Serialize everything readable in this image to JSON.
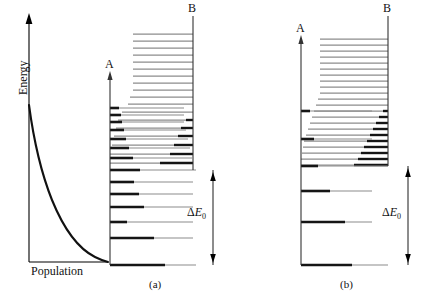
{
  "figure": {
    "type": "energy-level-diagram"
  },
  "population_panel": {
    "y_axis_label": "Energy",
    "x_axis_label": "Population",
    "curve_type": "exponential-decay",
    "axis_arrow": "up"
  },
  "panels": [
    {
      "id": "a",
      "caption": "(a)",
      "left_axis_label": "A",
      "right_axis_label": "B",
      "gap_label_delta": "Δ",
      "gap_label_e": "E",
      "gap_label_sub": "0"
    },
    {
      "id": "b",
      "caption": "(b)",
      "left_axis_label": "A",
      "right_axis_label": "B",
      "gap_label_delta": "Δ",
      "gap_label_e": "E",
      "gap_label_sub": "0"
    }
  ],
  "colors": {
    "line": "#000000",
    "level_gray": "#8c8c8c",
    "level_dark": "#151515",
    "background": "#ffffff"
  },
  "chart_data": {
    "type": "line",
    "title": "",
    "xlabel": "Population",
    "ylabel": "Energy",
    "series": [
      {
        "name": "Boltzmann population",
        "x": [
          0.0,
          0.06,
          0.13,
          0.2,
          0.28,
          0.36,
          0.45,
          0.55,
          0.66,
          0.78,
          0.9,
          1.0
        ],
        "y": [
          1.0,
          0.82,
          0.66,
          0.53,
          0.41,
          0.31,
          0.23,
          0.16,
          0.1,
          0.06,
          0.025,
          0.0
        ]
      }
    ],
    "xlim": [
      0,
      1
    ],
    "ylim": [
      0,
      1
    ],
    "grid": false,
    "legend": "none"
  },
  "levels_a": {
    "axis_a_top_y": 78,
    "axis_b_top_y": 16,
    "baseline_y": 265,
    "threshold_y": 170,
    "b_levels": [
      {
        "y": 34,
        "x1": 133,
        "x2": 193,
        "dark_from": null
      },
      {
        "y": 41,
        "x1": 133,
        "x2": 193,
        "dark_from": null
      },
      {
        "y": 48,
        "x1": 133,
        "x2": 193,
        "dark_from": null
      },
      {
        "y": 55,
        "x1": 133,
        "x2": 193,
        "dark_from": null
      },
      {
        "y": 62,
        "x1": 133,
        "x2": 193,
        "dark_from": null
      },
      {
        "y": 69,
        "x1": 133,
        "x2": 193,
        "dark_from": null
      },
      {
        "y": 76,
        "x1": 133,
        "x2": 193,
        "dark_from": null
      },
      {
        "y": 83,
        "x1": 133,
        "x2": 193,
        "dark_from": null
      },
      {
        "y": 90,
        "x1": 133,
        "x2": 193,
        "dark_from": null
      },
      {
        "y": 97,
        "x1": 130,
        "x2": 193,
        "dark_from": null
      },
      {
        "y": 104,
        "x1": 128,
        "x2": 193,
        "dark_from": null
      },
      {
        "y": 112,
        "x1": 122,
        "x2": 193,
        "dark_from": null
      },
      {
        "y": 120,
        "x1": 118,
        "x2": 193,
        "dark_from": 186
      },
      {
        "y": 128,
        "x1": 116,
        "x2": 193,
        "dark_from": 181
      },
      {
        "y": 136,
        "x1": 114,
        "x2": 193,
        "dark_from": 178
      },
      {
        "y": 145,
        "x1": 112,
        "x2": 193,
        "dark_from": 174
      },
      {
        "y": 154,
        "x1": 110,
        "x2": 193,
        "dark_from": 170
      },
      {
        "y": 163,
        "x1": 110,
        "x2": 193,
        "dark_from": 160
      }
    ],
    "a_levels": [
      {
        "y": 108,
        "x1": 110,
        "x2": 184,
        "dark_to": 119
      },
      {
        "y": 115,
        "x1": 110,
        "x2": 184,
        "dark_to": 121
      },
      {
        "y": 122,
        "x1": 110,
        "x2": 184,
        "dark_to": 122
      },
      {
        "y": 130,
        "x1": 110,
        "x2": 186,
        "dark_to": 124
      },
      {
        "y": 139,
        "x1": 110,
        "x2": 188,
        "dark_to": 126
      },
      {
        "y": 148,
        "x1": 110,
        "x2": 190,
        "dark_to": 129
      },
      {
        "y": 158,
        "x1": 110,
        "x2": 192,
        "dark_to": 133
      },
      {
        "y": 170,
        "x1": 110,
        "x2": 196,
        "dark_to": 140
      },
      {
        "y": 182,
        "x1": 110,
        "x2": 193,
        "dark_to": 134
      },
      {
        "y": 194,
        "x1": 110,
        "x2": 193,
        "dark_to": 139
      },
      {
        "y": 207,
        "x1": 110,
        "x2": 193,
        "dark_to": 144
      },
      {
        "y": 222,
        "x1": 110,
        "x2": 193,
        "dark_to": 127
      },
      {
        "y": 238,
        "x1": 110,
        "x2": 193,
        "dark_to": 154
      },
      {
        "y": 265,
        "x1": 110,
        "x2": 196,
        "dark_to": 165
      }
    ]
  },
  "levels_b": {
    "axis_a_top_y": 42,
    "axis_b_top_y": 16,
    "baseline_y": 265,
    "threshold_y": 166,
    "b_levels": [
      {
        "y": 39,
        "x1": 320,
        "x2": 388,
        "dark_from": null
      },
      {
        "y": 45,
        "x1": 320,
        "x2": 388,
        "dark_from": null
      },
      {
        "y": 51,
        "x1": 320,
        "x2": 388,
        "dark_from": null
      },
      {
        "y": 57,
        "x1": 320,
        "x2": 388,
        "dark_from": null
      },
      {
        "y": 63,
        "x1": 320,
        "x2": 388,
        "dark_from": null
      },
      {
        "y": 69,
        "x1": 320,
        "x2": 388,
        "dark_from": null
      },
      {
        "y": 75,
        "x1": 320,
        "x2": 388,
        "dark_from": null
      },
      {
        "y": 81,
        "x1": 320,
        "x2": 388,
        "dark_from": null
      },
      {
        "y": 87,
        "x1": 320,
        "x2": 388,
        "dark_from": null
      },
      {
        "y": 93,
        "x1": 320,
        "x2": 388,
        "dark_from": null
      },
      {
        "y": 99,
        "x1": 318,
        "x2": 388,
        "dark_from": null
      },
      {
        "y": 105,
        "x1": 316,
        "x2": 388,
        "dark_from": null
      },
      {
        "y": 111,
        "x1": 314,
        "x2": 388,
        "dark_from": 383
      },
      {
        "y": 117,
        "x1": 312,
        "x2": 388,
        "dark_from": 379
      },
      {
        "y": 123,
        "x1": 310,
        "x2": 388,
        "dark_from": 376
      },
      {
        "y": 129,
        "x1": 308,
        "x2": 388,
        "dark_from": 373
      },
      {
        "y": 135,
        "x1": 306,
        "x2": 388,
        "dark_from": 370
      },
      {
        "y": 141,
        "x1": 304,
        "x2": 388,
        "dark_from": 367
      },
      {
        "y": 147,
        "x1": 303,
        "x2": 388,
        "dark_from": 364
      },
      {
        "y": 153,
        "x1": 302,
        "x2": 388,
        "dark_from": 361
      },
      {
        "y": 159,
        "x1": 301,
        "x2": 388,
        "dark_from": 358
      },
      {
        "y": 165,
        "x1": 301,
        "x2": 388,
        "dark_from": 354
      }
    ],
    "a_levels": [
      {
        "y": 111,
        "x1": 301,
        "x2": 372,
        "dark_to": 310
      },
      {
        "y": 139,
        "x1": 301,
        "x2": 372,
        "dark_to": 314
      },
      {
        "y": 166,
        "x1": 301,
        "x2": 388,
        "dark_to": 318
      },
      {
        "y": 191,
        "x1": 301,
        "x2": 372,
        "dark_to": 330
      },
      {
        "y": 222,
        "x1": 301,
        "x2": 372,
        "dark_to": 345
      },
      {
        "y": 265,
        "x1": 301,
        "x2": 388,
        "dark_to": 352
      }
    ]
  }
}
